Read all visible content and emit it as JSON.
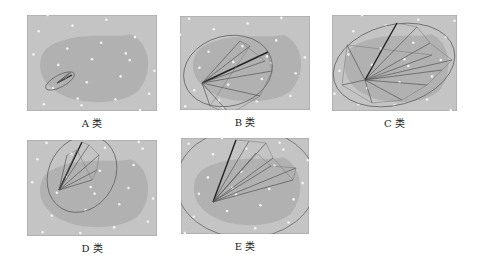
{
  "figure": {
    "panels": [
      {
        "id": "A",
        "label": "A 类",
        "x": 27,
        "y": 15,
        "w": 130,
        "h": 96,
        "center": [
          30,
          68
        ],
        "ellipse": {
          "cx": 33,
          "cy": 66,
          "rx": 16,
          "ry": 6,
          "rot": -28
        },
        "rays": [
          [
            45,
            60
          ],
          [
            42,
            58
          ],
          [
            40,
            62
          ],
          [
            38,
            64
          ],
          [
            44,
            57
          ]
        ]
      },
      {
        "id": "B",
        "label": "B 类",
        "x": 180,
        "y": 16,
        "w": 130,
        "h": 94,
        "center": [
          22,
          67
        ],
        "ellipse": {
          "cx": 48,
          "cy": 55,
          "rx": 45,
          "ry": 35,
          "rot": -15
        },
        "rays": [
          [
            88,
            36
          ],
          [
            92,
            55
          ],
          [
            80,
            80
          ],
          [
            50,
            98
          ],
          [
            30,
            90
          ],
          [
            70,
            30
          ],
          [
            60,
            25
          ],
          [
            85,
            45
          ]
        ]
      },
      {
        "id": "C",
        "label": "C 类",
        "x": 332,
        "y": 15,
        "w": 125,
        "h": 96,
        "center": [
          33,
          65
        ],
        "ellipse": {
          "cx": 62,
          "cy": 50,
          "rx": 62,
          "ry": 40,
          "rot": -15
        },
        "rays": [
          [
            65,
            8
          ],
          [
            85,
            12
          ],
          [
            98,
            28
          ],
          [
            120,
            45
          ],
          [
            110,
            55
          ],
          [
            95,
            70
          ],
          [
            70,
            85
          ],
          [
            40,
            88
          ],
          [
            10,
            70
          ],
          [
            15,
            30
          ],
          [
            100,
            40
          ]
        ]
      },
      {
        "id": "D",
        "label": "D 类",
        "x": 27,
        "y": 140,
        "w": 130,
        "h": 96,
        "center": [
          32,
          50
        ],
        "ellipse": {
          "cx": 55,
          "cy": 34,
          "rx": 33,
          "ry": 40,
          "rot": 30
        },
        "rays": [
          [
            55,
            2
          ],
          [
            62,
            5
          ],
          [
            72,
            15
          ],
          [
            70,
            30
          ],
          [
            65,
            40
          ],
          [
            50,
            10
          ],
          [
            40,
            15
          ]
        ]
      },
      {
        "id": "E",
        "label": "E 类",
        "x": 181,
        "y": 138,
        "w": 128,
        "h": 96,
        "center": [
          32,
          64
        ],
        "ellipse": {
          "cx": 65,
          "cy": 45,
          "rx": 70,
          "ry": 55,
          "rot": 0
        },
        "rays": [
          [
            55,
            2
          ],
          [
            68,
            3
          ],
          [
            85,
            5
          ],
          [
            92,
            20
          ],
          [
            112,
            42
          ],
          [
            115,
            30
          ],
          [
            90,
            28
          ],
          [
            75,
            15
          ]
        ]
      }
    ]
  }
}
